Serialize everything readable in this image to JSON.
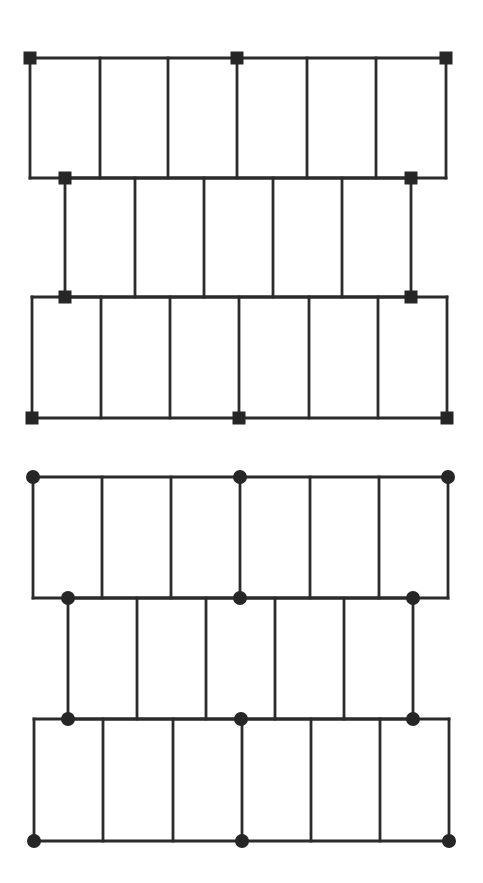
{
  "canvas": {
    "width": 483,
    "height": 883,
    "background": "#ffffff",
    "line_color": "#2b2b2b",
    "marker_color": "#262626"
  },
  "diagrams": [
    {
      "name": "square-node-frame",
      "marker_shape": "square",
      "marker_size": 13,
      "bands": [
        {
          "top": 58,
          "bottom": 178,
          "x": [
            30,
            100,
            168,
            237,
            307,
            376,
            446
          ],
          "outline": true
        },
        {
          "top": 178,
          "bottom": 297,
          "x": [
            65,
            135,
            204,
            273,
            342,
            411
          ],
          "outline": false
        },
        {
          "top": 297,
          "bottom": 418,
          "x": [
            32,
            101,
            170,
            239,
            309,
            378,
            447
          ],
          "outline": true
        }
      ],
      "markers": [
        [
          30,
          58
        ],
        [
          237,
          58
        ],
        [
          446,
          58
        ],
        [
          65,
          178
        ],
        [
          411,
          178
        ],
        [
          65,
          297
        ],
        [
          411,
          297
        ],
        [
          32,
          418
        ],
        [
          239,
          418
        ],
        [
          447,
          418
        ]
      ]
    },
    {
      "name": "circle-node-frame",
      "marker_shape": "circle",
      "marker_size": 14,
      "bands": [
        {
          "top": 477,
          "bottom": 598,
          "x": [
            33,
            102,
            171,
            240,
            310,
            379,
            448
          ],
          "outline": true
        },
        {
          "top": 598,
          "bottom": 719,
          "x": [
            68,
            137,
            206,
            275,
            344,
            413
          ],
          "outline": false
        },
        {
          "top": 719,
          "bottom": 841,
          "x": [
            34,
            103,
            173,
            242,
            311,
            380,
            449
          ],
          "outline": true
        }
      ],
      "markers": [
        [
          33,
          477
        ],
        [
          240,
          477
        ],
        [
          448,
          477
        ],
        [
          68,
          598
        ],
        [
          240,
          598
        ],
        [
          413,
          598
        ],
        [
          68,
          719
        ],
        [
          241,
          719
        ],
        [
          413,
          719
        ],
        [
          34,
          841
        ],
        [
          242,
          841
        ],
        [
          449,
          841
        ]
      ]
    }
  ]
}
